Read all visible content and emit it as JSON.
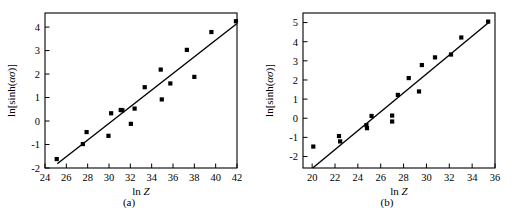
{
  "figure": {
    "panels": [
      {
        "caption": "(a)",
        "chart_data": {
          "type": "scatter",
          "title": "",
          "xlabel": "ln Z",
          "ylabel": "ln[sinh(ασ)]",
          "xlim": [
            24,
            42
          ],
          "ylim": [
            -2,
            4.6
          ],
          "xticks": [
            24,
            26,
            28,
            30,
            32,
            34,
            36,
            38,
            40,
            42
          ],
          "yticks": [
            -2,
            -1,
            0,
            1,
            2,
            3,
            4
          ],
          "grid": false,
          "legend": "none",
          "marker": "filled-square",
          "marker_color": "#000000",
          "points": [
            {
              "x": 25.1,
              "y": -1.62
            },
            {
              "x": 27.55,
              "y": -0.98
            },
            {
              "x": 27.9,
              "y": -0.47
            },
            {
              "x": 29.95,
              "y": -0.63
            },
            {
              "x": 30.2,
              "y": 0.33
            },
            {
              "x": 31.1,
              "y": 0.47
            },
            {
              "x": 31.25,
              "y": 0.46
            },
            {
              "x": 32.05,
              "y": -0.12
            },
            {
              "x": 32.4,
              "y": 0.53
            },
            {
              "x": 33.35,
              "y": 1.44
            },
            {
              "x": 34.85,
              "y": 2.19
            },
            {
              "x": 34.95,
              "y": 0.92
            },
            {
              "x": 35.75,
              "y": 1.6
            },
            {
              "x": 37.3,
              "y": 3.03
            },
            {
              "x": 38.0,
              "y": 1.88
            },
            {
              "x": 39.6,
              "y": 3.79
            },
            {
              "x": 41.9,
              "y": 4.25
            }
          ],
          "fit_line": {
            "x0": 25.15,
            "y0": -1.82,
            "x1": 42.0,
            "y1": 4.15
          }
        }
      },
      {
        "caption": "(b)",
        "chart_data": {
          "type": "scatter",
          "title": "",
          "xlabel": "ln Z",
          "ylabel": "ln[sinh(ασ)]",
          "xlim": [
            19.2,
            36
          ],
          "ylim": [
            -2.6,
            5.5
          ],
          "xticks": [
            20,
            22,
            24,
            26,
            28,
            30,
            32,
            34,
            36
          ],
          "yticks": [
            -2,
            -1,
            0,
            1,
            2,
            3,
            4,
            5
          ],
          "grid": false,
          "legend": "none",
          "marker": "filled-square",
          "marker_color": "#000000",
          "points": [
            {
              "x": 20.1,
              "y": -1.48
            },
            {
              "x": 22.35,
              "y": -0.93
            },
            {
              "x": 22.45,
              "y": -1.21
            },
            {
              "x": 24.75,
              "y": -0.36
            },
            {
              "x": 24.8,
              "y": -0.52
            },
            {
              "x": 25.2,
              "y": 0.12
            },
            {
              "x": 27.0,
              "y": 0.14
            },
            {
              "x": 27.0,
              "y": -0.17
            },
            {
              "x": 27.5,
              "y": 1.22
            },
            {
              "x": 28.45,
              "y": 2.1
            },
            {
              "x": 29.35,
              "y": 1.4
            },
            {
              "x": 29.6,
              "y": 2.78
            },
            {
              "x": 30.75,
              "y": 3.18
            },
            {
              "x": 32.15,
              "y": 3.33
            },
            {
              "x": 33.05,
              "y": 4.22
            },
            {
              "x": 35.4,
              "y": 5.05
            }
          ],
          "fit_line": {
            "x0": 20.05,
            "y0": -2.6,
            "x1": 35.45,
            "y1": 5.0
          }
        }
      }
    ]
  }
}
